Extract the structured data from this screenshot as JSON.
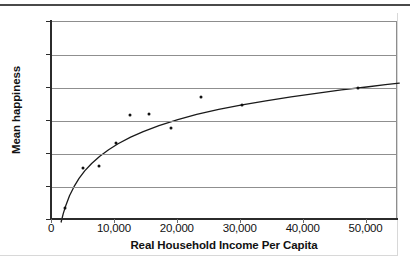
{
  "chart_data": {
    "type": "scatter",
    "title": "",
    "xlabel": "Real Household Income Per Capita",
    "ylabel": "Mean happiness",
    "xlim": [
      0,
      55000
    ],
    "ylim": [
      1.9,
      2.5
    ],
    "grid": true,
    "legend": "none",
    "xticks": [
      "0",
      "10,000",
      "20,000",
      "30,000",
      "40,000",
      "50,000"
    ],
    "xtick_values": [
      0,
      10000,
      20000,
      30000,
      40000,
      50000
    ],
    "yticks": [
      "1.9",
      "2.0",
      "2.1",
      "2.2",
      "2.3",
      "2.4",
      "2.5"
    ],
    "ytick_values": [
      1.9,
      2.0,
      2.1,
      2.2,
      2.3,
      2.4,
      2.5
    ],
    "points": [
      {
        "x": 2100,
        "y": 1.935
      },
      {
        "x": 5000,
        "y": 2.057
      },
      {
        "x": 7400,
        "y": 2.065
      },
      {
        "x": 10100,
        "y": 2.133
      },
      {
        "x": 12400,
        "y": 2.218
      },
      {
        "x": 15400,
        "y": 2.221
      },
      {
        "x": 18900,
        "y": 2.18
      },
      {
        "x": 23700,
        "y": 2.272
      },
      {
        "x": 30200,
        "y": 2.25
      },
      {
        "x": 48700,
        "y": 2.3
      }
    ],
    "fit_curve": {
      "name": "logarithmic fit",
      "points": [
        {
          "x": 1450,
          "y": 1.894
        },
        {
          "x": 1800,
          "y": 1.92
        },
        {
          "x": 2200,
          "y": 1.944
        },
        {
          "x": 2800,
          "y": 1.974
        },
        {
          "x": 3500,
          "y": 2.001
        },
        {
          "x": 4300,
          "y": 2.026
        },
        {
          "x": 5200,
          "y": 2.049
        },
        {
          "x": 6300,
          "y": 2.071
        },
        {
          "x": 7600,
          "y": 2.093
        },
        {
          "x": 9000,
          "y": 2.113
        },
        {
          "x": 10500,
          "y": 2.131
        },
        {
          "x": 12500,
          "y": 2.151
        },
        {
          "x": 14500,
          "y": 2.168
        },
        {
          "x": 17000,
          "y": 2.186
        },
        {
          "x": 20000,
          "y": 2.204
        },
        {
          "x": 23000,
          "y": 2.22
        },
        {
          "x": 26500,
          "y": 2.235
        },
        {
          "x": 30000,
          "y": 2.248
        },
        {
          "x": 34000,
          "y": 2.261
        },
        {
          "x": 38000,
          "y": 2.273
        },
        {
          "x": 42000,
          "y": 2.284
        },
        {
          "x": 46000,
          "y": 2.294
        },
        {
          "x": 50000,
          "y": 2.303
        },
        {
          "x": 53000,
          "y": 2.31
        },
        {
          "x": 55200,
          "y": 2.315
        }
      ]
    }
  },
  "axes": {
    "y_label": "Mean happiness",
    "x_label": "Real Household Income Per Capita"
  }
}
